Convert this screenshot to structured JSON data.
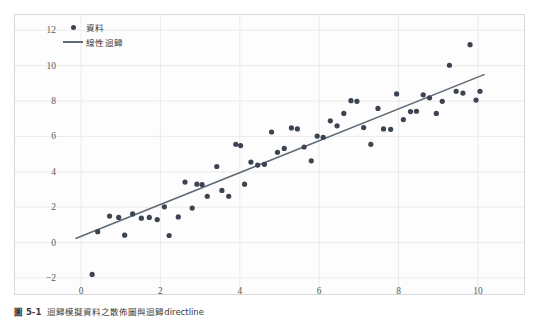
{
  "caption": {
    "label": "圖 5-1",
    "text": "迴歸模擬資料之散佈圖與迴歸directline"
  },
  "legend": {
    "position": "upper-left",
    "entries": [
      {
        "label": "資料",
        "marker": "dot-marker",
        "color": "#3b4450"
      },
      {
        "label": "線性迴歸",
        "marker": "line-marker",
        "color": "#5f6a76"
      }
    ]
  },
  "colors": {
    "point": "#3b4450",
    "line": "#5f6a76",
    "grid": "#ebebeb",
    "frame": "#d8d8d8",
    "panel": "#fdfdfd",
    "tick_text": "#5a5a5a"
  },
  "chart_data": {
    "type": "scatter",
    "title": "",
    "xlabel": "",
    "ylabel": "",
    "xlim": [
      -0.55,
      10.65
    ],
    "ylim": [
      -2.6,
      12.4
    ],
    "xticks": [
      0,
      2,
      4,
      6,
      8,
      10
    ],
    "yticks": [
      -2,
      0,
      2,
      4,
      6,
      8,
      10,
      12
    ],
    "grid": true,
    "series": [
      {
        "name": "資料",
        "type": "scatter",
        "points": [
          [
            0.28,
            -1.8
          ],
          [
            0.42,
            0.62
          ],
          [
            0.72,
            1.5
          ],
          [
            0.95,
            1.42
          ],
          [
            1.1,
            0.42
          ],
          [
            1.3,
            1.62
          ],
          [
            1.52,
            1.38
          ],
          [
            1.72,
            1.42
          ],
          [
            1.92,
            1.3
          ],
          [
            2.1,
            2.02
          ],
          [
            2.22,
            0.4
          ],
          [
            2.45,
            1.45
          ],
          [
            2.62,
            3.42
          ],
          [
            2.8,
            1.95
          ],
          [
            2.92,
            3.3
          ],
          [
            3.05,
            3.28
          ],
          [
            3.18,
            2.62
          ],
          [
            3.42,
            4.3
          ],
          [
            3.55,
            2.95
          ],
          [
            3.72,
            2.62
          ],
          [
            3.9,
            5.55
          ],
          [
            4.02,
            5.48
          ],
          [
            4.12,
            3.3
          ],
          [
            4.28,
            4.55
          ],
          [
            4.45,
            4.38
          ],
          [
            4.62,
            4.42
          ],
          [
            4.8,
            6.25
          ],
          [
            4.95,
            5.1
          ],
          [
            5.12,
            5.32
          ],
          [
            5.3,
            6.48
          ],
          [
            5.45,
            6.42
          ],
          [
            5.62,
            5.4
          ],
          [
            5.8,
            4.62
          ],
          [
            5.95,
            6.02
          ],
          [
            6.1,
            5.95
          ],
          [
            6.28,
            6.88
          ],
          [
            6.45,
            6.6
          ],
          [
            6.62,
            7.3
          ],
          [
            6.8,
            8.02
          ],
          [
            6.95,
            7.98
          ],
          [
            7.12,
            6.5
          ],
          [
            7.3,
            5.55
          ],
          [
            7.48,
            7.58
          ],
          [
            7.62,
            6.42
          ],
          [
            7.8,
            6.4
          ],
          [
            7.95,
            8.4
          ],
          [
            8.12,
            6.95
          ],
          [
            8.3,
            7.4
          ],
          [
            8.45,
            7.42
          ],
          [
            8.62,
            8.35
          ],
          [
            8.78,
            8.18
          ],
          [
            8.95,
            7.3
          ],
          [
            9.1,
            7.98
          ],
          [
            9.28,
            10.02
          ],
          [
            9.45,
            8.55
          ],
          [
            9.62,
            8.45
          ],
          [
            9.8,
            11.18
          ],
          [
            9.95,
            8.05
          ],
          [
            10.05,
            8.55
          ]
        ]
      },
      {
        "name": "線性迴歸",
        "type": "line",
        "slope": 0.9,
        "intercept": 0.35,
        "endpoints": [
          [
            -0.12,
            0.24
          ],
          [
            10.15,
            9.49
          ]
        ]
      }
    ]
  }
}
